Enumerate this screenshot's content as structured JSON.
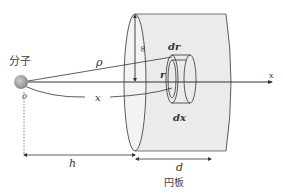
{
  "diagram": {
    "labels": {
      "molecule": "分子",
      "origin": "0",
      "rho": "ρ",
      "x_curve": "x",
      "infinity": "∞",
      "dr": "dr",
      "r": "r",
      "dx": "dx",
      "x_axis": "x",
      "h": "h",
      "d": "d",
      "plate": "円板"
    },
    "colors": {
      "line": "#333333",
      "cylinder_fill": "#ebebeb",
      "molecule_fill": "#999999"
    }
  }
}
